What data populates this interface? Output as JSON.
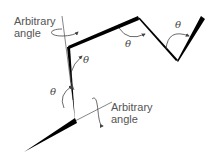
{
  "diagram": {
    "labels": {
      "top_arbitrary": [
        "Arbitrary",
        "angle"
      ],
      "bottom_arbitrary": [
        "Arbitrary",
        "angle"
      ],
      "theta": "θ"
    },
    "colors": {
      "chain": "#000000",
      "axis": "#555555",
      "arrow": "#444444",
      "text": "#555555"
    }
  }
}
